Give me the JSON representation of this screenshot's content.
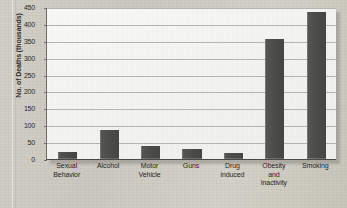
{
  "chart_data": {
    "type": "bar",
    "title": "",
    "subtitle": "",
    "xlabel": "",
    "ylabel": "No. of Deaths (thousands)",
    "categories": [
      "Sexual\nBehavior",
      "Alcohol",
      "Motor\nVehicle",
      "Guns",
      "Drug\ninduced",
      "Obesity\nand\nInactivity",
      "Smoking"
    ],
    "category_lines": [
      [
        "Sexual",
        "Behavior"
      ],
      [
        "Alcohol"
      ],
      [
        "Motor",
        "Vehicle"
      ],
      [
        "Guns"
      ],
      [
        "Drug",
        "induced"
      ],
      [
        "Obesity",
        "and",
        "Inactivity"
      ],
      [
        "Smoking"
      ]
    ],
    "values": [
      20,
      85,
      40,
      29,
      17,
      355,
      435
    ],
    "ylim": [
      0,
      450
    ],
    "ytick_values": [
      0,
      50,
      100,
      150,
      200,
      250,
      300,
      350,
      400,
      450
    ],
    "ytick_labels": [
      "0",
      "50",
      "100",
      "150",
      "200",
      "250",
      "300",
      "350",
      "400",
      "450"
    ],
    "grid": true,
    "grid_axis": "y",
    "legend": false,
    "legend_position": "none",
    "bar_color": "#4c4c4a",
    "plot_background": "#f4f4f2",
    "gridline_color": "#b4b4b2",
    "axis_color": "#4a4a4a",
    "page_background": "#cfccc3",
    "text_color": "#1f1f1f"
  }
}
